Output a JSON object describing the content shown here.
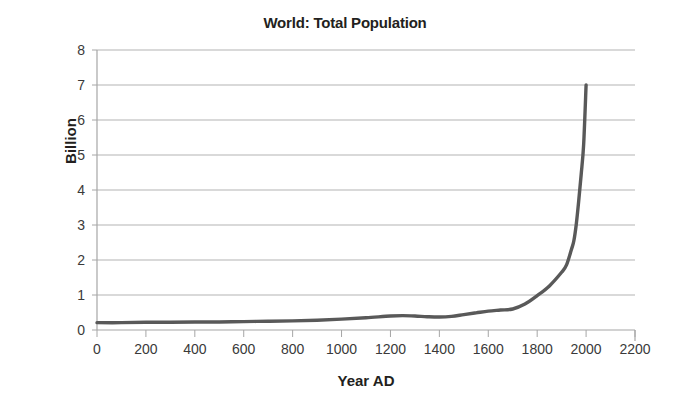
{
  "chart_data": {
    "type": "line",
    "title": "World: Total Population",
    "xlabel": "Year AD",
    "ylabel": "Billion",
    "xlim": [
      0,
      2200
    ],
    "ylim": [
      0,
      8
    ],
    "xticks": [
      0,
      200,
      400,
      600,
      800,
      1000,
      1200,
      1400,
      1600,
      1800,
      2000,
      2200
    ],
    "yticks": [
      0,
      1,
      2,
      3,
      4,
      5,
      6,
      7,
      8
    ],
    "grid": "horizontal",
    "legend": null,
    "line_color": "#595959",
    "x": [
      0,
      100,
      200,
      300,
      400,
      500,
      600,
      700,
      800,
      900,
      1000,
      1100,
      1200,
      1250,
      1300,
      1350,
      1400,
      1450,
      1500,
      1550,
      1600,
      1650,
      1700,
      1750,
      1800,
      1850,
      1900,
      1920,
      1940,
      1950,
      1960,
      1970,
      1980,
      1990,
      2000
    ],
    "values": [
      0.21,
      0.21,
      0.22,
      0.22,
      0.23,
      0.23,
      0.24,
      0.25,
      0.26,
      0.28,
      0.31,
      0.35,
      0.4,
      0.41,
      0.4,
      0.38,
      0.37,
      0.39,
      0.44,
      0.49,
      0.54,
      0.57,
      0.6,
      0.74,
      0.98,
      1.26,
      1.65,
      1.86,
      2.3,
      2.55,
      3.03,
      3.7,
      4.45,
      5.3,
      7.0
    ]
  },
  "ytick_labels": [
    "8",
    "7",
    "6",
    "5",
    "4",
    "3",
    "2",
    "1",
    "0"
  ],
  "xtick_labels": [
    "0",
    "200",
    "400",
    "600",
    "800",
    "1000",
    "1200",
    "1400",
    "1600",
    "1800",
    "2000",
    "2200"
  ]
}
